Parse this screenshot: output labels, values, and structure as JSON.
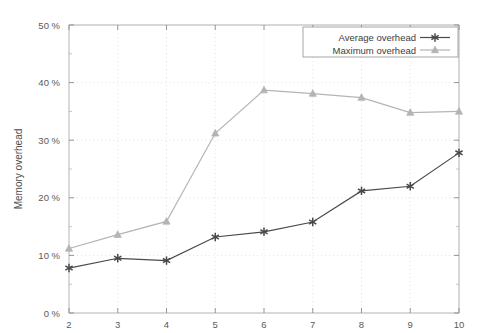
{
  "chart_data": {
    "type": "line",
    "title": "",
    "xlabel": "Tree height",
    "ylabel": "Memory overhead",
    "x": [
      2,
      3,
      4,
      5,
      6,
      7,
      8,
      9,
      10
    ],
    "xtick_labels": [
      "2",
      "3",
      "4",
      "5",
      "6",
      "7",
      "8",
      "9",
      "10"
    ],
    "ytick_labels": [
      "0 %",
      "10 %",
      "20 %",
      "30 %",
      "40 %",
      "50 %"
    ],
    "ytick_values": [
      0,
      10,
      20,
      30,
      40,
      50
    ],
    "xlim": [
      2,
      10
    ],
    "ylim": [
      0,
      50
    ],
    "grid": true,
    "legend_position": "top-right",
    "series": [
      {
        "name": "Average overhead",
        "marker": "asterisk",
        "color": "#4a4a4a",
        "values": [
          7.8,
          9.5,
          9.1,
          13.2,
          14.1,
          15.8,
          21.2,
          22.0,
          27.8
        ]
      },
      {
        "name": "Maximum overhead",
        "marker": "triangle",
        "color": "#b4b4b4",
        "values": [
          11.2,
          13.6,
          15.9,
          31.2,
          38.7,
          38.1,
          37.4,
          34.8,
          35.0
        ]
      }
    ]
  },
  "legend": {
    "entries": [
      {
        "label": "Average overhead"
      },
      {
        "label": "Maximum overhead"
      }
    ]
  },
  "axes": {
    "x_title": "Tree height",
    "y_title": "Memory overhead"
  }
}
